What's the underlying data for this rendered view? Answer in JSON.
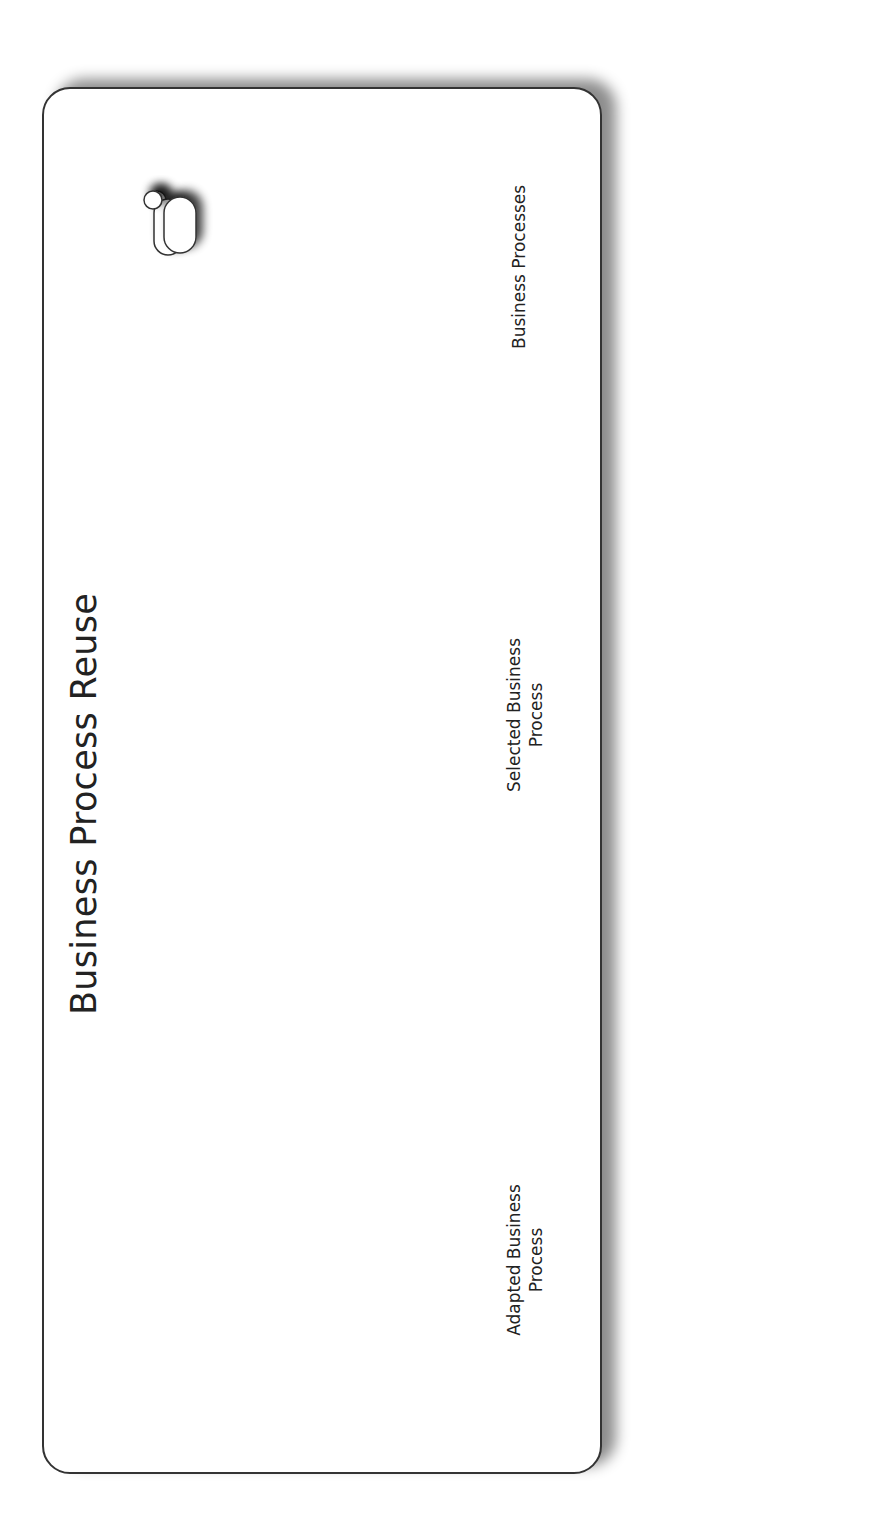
{
  "panels": {
    "process": {
      "title": "Business Process Reuse"
    },
    "software": {
      "title": "Business Software Reuse"
    }
  },
  "process_stages": [
    {
      "id": "business-processes",
      "label": "Business Processes"
    },
    {
      "id": "selected-business-process",
      "label_line1": "Selected Business",
      "label_line2": "Process"
    },
    {
      "id": "adapted-business-process",
      "label_line1": "Adapted Business",
      "label_line2": "Process"
    }
  ],
  "process_arrows": [
    {
      "id": "process-selection",
      "label": "Process Selection"
    },
    {
      "id": "process-adaptation",
      "label": "Process Adaptation"
    }
  ],
  "adaptation_rules": {
    "label": "Adaptation Rules",
    "link_label": "Adaptation by Rules"
  },
  "software_stages": [
    {
      "id": "software-repository",
      "label": "Software Repository"
    },
    {
      "id": "selected-software",
      "label": "Selected Software"
    },
    {
      "id": "adapted-software",
      "label": "Adapted Software"
    }
  ],
  "software_arrows": [
    {
      "id": "sw-selection",
      "label": "SW Selection"
    },
    {
      "id": "sw-adaptation",
      "label": "SW Adaptation"
    }
  ],
  "colors": {
    "arrow_fill": "#8c8c8c",
    "panel_border": "#333333",
    "highlight_task": "#dcdcdc"
  }
}
